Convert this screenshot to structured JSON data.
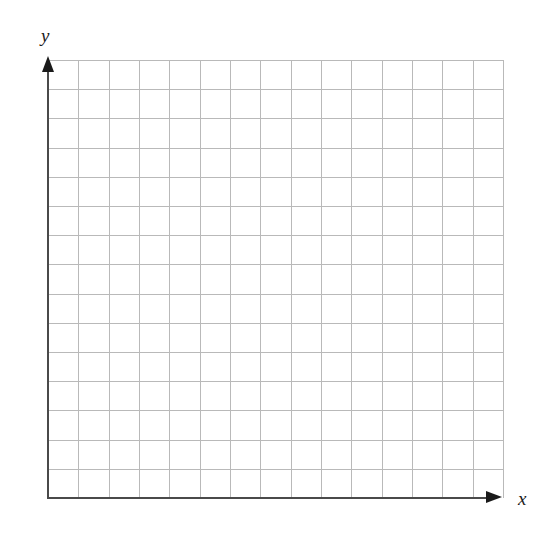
{
  "figure": {
    "title": "",
    "background_color": "#ffffff"
  },
  "axes": {
    "x": {
      "label": "x",
      "label_style": "italic-serif",
      "arrow_direction": "right",
      "line_color": "#4a4a4a",
      "arrow_color": "#1a1a1a"
    },
    "y": {
      "label": "y",
      "label_style": "italic-serif",
      "arrow_direction": "up",
      "line_color": "#4a4a4a",
      "arrow_color": "#1a1a1a"
    }
  },
  "grid": {
    "color": "#b9b9b9",
    "columns": 15,
    "rows": 15,
    "cell_width_px": 30.33,
    "cell_height_px": 29.2,
    "visible": true
  },
  "chart_data": {
    "type": "line",
    "title": "",
    "subtitle": "",
    "xlabel": "x",
    "ylabel": "y",
    "series": [],
    "x": [],
    "categories": [],
    "values": [],
    "xticklabels": [],
    "yticklabels": [],
    "xlim": [
      0,
      15
    ],
    "ylim": [
      0,
      15
    ],
    "grid": true,
    "legend": false,
    "legend_position": "none",
    "annotations": [],
    "note": "Blank Cartesian coordinate plane: empty square grid with labelled x and y axes, no plotted data points, no tick numbers."
  }
}
